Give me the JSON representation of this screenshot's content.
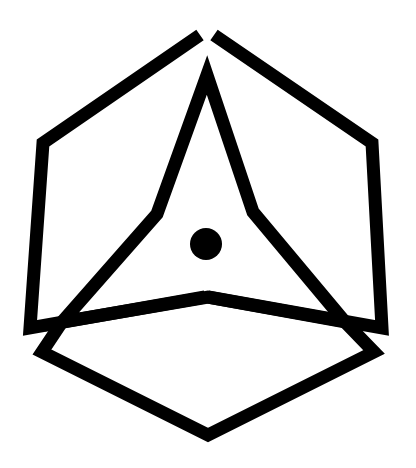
{
  "icon": {
    "name": "cube-triangle-logo",
    "stroke_color": "#000000",
    "background_color": "#ffffff",
    "stroke_width": 13,
    "center_dot_radius": 16
  }
}
